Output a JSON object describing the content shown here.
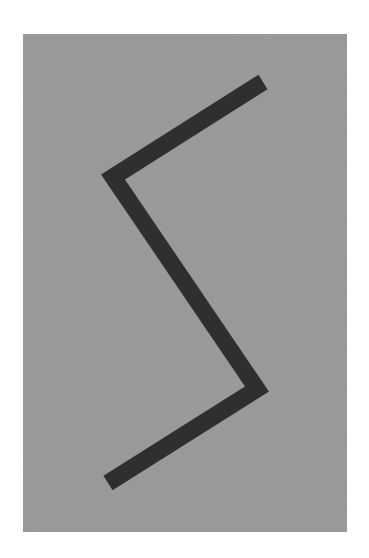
{
  "artwork": {
    "background_color": "#ffffff",
    "canvas_color": "#989898",
    "stroke_color": "#2f2f2f",
    "stroke_width": 17,
    "canvas_rect": {
      "x": 23,
      "y": 34,
      "width": 324,
      "height": 498
    },
    "zigzag_points": [
      [
        263,
        82
      ],
      [
        113,
        177
      ],
      [
        257,
        389
      ],
      [
        108,
        483
      ]
    ]
  }
}
